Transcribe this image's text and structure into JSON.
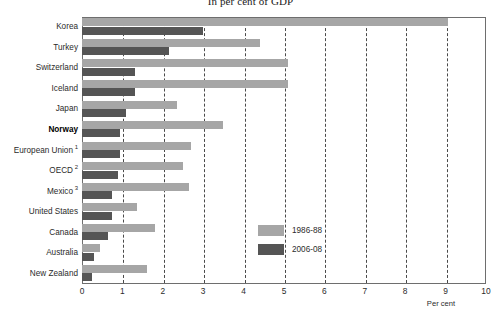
{
  "title": "In per cent of GDP",
  "colors": {
    "series_old": "#a6a6a6",
    "series_new": "#555555",
    "axis": "#6e6e6e",
    "grid": "#4a4a4a",
    "text": "#2b2b2b"
  },
  "axis": {
    "x_title": "Per cent",
    "ticks": [
      "0",
      "1",
      "2",
      "3",
      "4",
      "5",
      "6",
      "7",
      "8",
      "9",
      "10"
    ]
  },
  "legend": {
    "items": [
      {
        "label": "1986-88",
        "color": "#a6a6a6",
        "name": "legend-item-1986-88"
      },
      {
        "label": "2006-08",
        "color": "#555555",
        "name": "legend-item-2006-08"
      }
    ]
  },
  "footnote": "",
  "chart_data": {
    "type": "bar",
    "orientation": "horizontal",
    "title": "In per cent of GDP",
    "xlabel": "Per cent",
    "ylabel": "",
    "xlim": [
      0,
      10
    ],
    "grid": true,
    "grid_axis": "x",
    "legend_position": "inside-right",
    "categories": [
      "Korea",
      "Turkey",
      "Switzerland",
      "Iceland",
      "Japan",
      "Norway",
      "European Union",
      "OECD",
      "Mexico",
      "United States",
      "Canada",
      "Australia",
      "New Zealand"
    ],
    "category_footnote_marks": [
      "",
      "",
      "",
      "",
      "",
      "",
      "1",
      "2",
      "3",
      "",
      "",
      "",
      ""
    ],
    "emphasised_category": "Norway",
    "series": [
      {
        "name": "1986-88",
        "color": "#a6a6a6",
        "values": [
          9.05,
          4.4,
          5.1,
          5.1,
          2.35,
          3.5,
          2.7,
          2.5,
          2.65,
          1.35,
          1.8,
          0.45,
          1.6
        ]
      },
      {
        "name": "2006-08",
        "color": "#555555",
        "values": [
          3.0,
          2.15,
          1.3,
          1.3,
          1.1,
          0.95,
          0.95,
          0.9,
          0.75,
          0.75,
          0.65,
          0.3,
          0.25
        ]
      }
    ]
  }
}
